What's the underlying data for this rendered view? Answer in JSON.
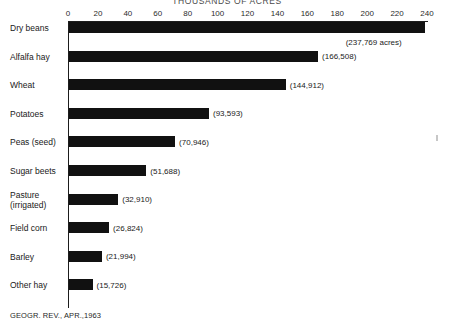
{
  "chart_data": {
    "type": "bar",
    "orientation": "horizontal",
    "title": "THOUSANDS OF ACRES",
    "xlabel": "",
    "ylabel": "",
    "xlim": [
      0,
      240
    ],
    "grid": false,
    "legend": null,
    "axis_ticks": [
      0,
      20,
      40,
      60,
      80,
      100,
      120,
      140,
      160,
      180,
      200,
      220,
      240
    ],
    "categories": [
      "Dry beans",
      "Alfalfa hay",
      "Wheat",
      "Potatoes",
      "Peas (seed)",
      "Sugar beets",
      "Pasture\n(irrigated)",
      "Field corn",
      "Barley",
      "Other hay"
    ],
    "values": [
      237.769,
      166.508,
      144.912,
      93.593,
      70.946,
      51.688,
      32.91,
      26.824,
      21.994,
      15.726
    ],
    "data_labels": [
      "(237,769 acres)",
      "(166,508)",
      "(144,912)",
      "(93,593)",
      "(70,946)",
      "(51,688)",
      "(32,910)",
      "(26,824)",
      "(21,994)",
      "(15,726)"
    ],
    "units": "thousands of acres",
    "bar_color": "#111111",
    "source": "GEOGR. REV., APR.,1963"
  },
  "source_note": "GEOGR. REV., APR.,1963"
}
